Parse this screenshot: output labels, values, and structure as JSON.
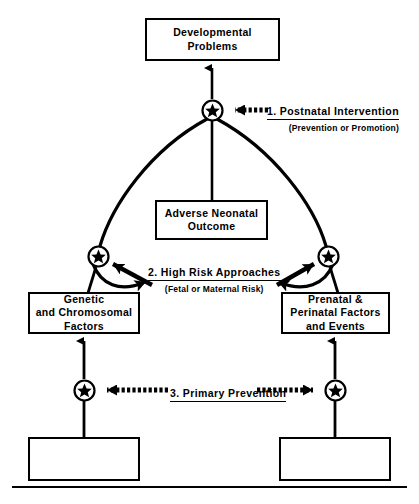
{
  "figure": {
    "accent_color": "#000000",
    "background_color": "#ffffff"
  },
  "boxes": {
    "developmental_problems": "Developmental\nProblems",
    "adverse_neonatal_outcome": "Adverse  Neonatal\nOutcome",
    "genetic_factors": "Genetic\nand  Chromosomal\nFactors",
    "prenatal_factors": "Prenatal   &\nPerinatal   Factors\nand  Events",
    "bottom_left_empty": "",
    "bottom_right_empty": ""
  },
  "interventions": [
    {
      "number": "1.",
      "label": "1. Postnatal Intervention",
      "sublabel": "(Prevention  or  Promotion)"
    },
    {
      "number": "2.",
      "label": "2. High  Risk  Approaches",
      "sublabel": "(Fetal or Maternal Risk)"
    },
    {
      "number": "3.",
      "label": "3.   Primary  Prevention",
      "sublabel": ""
    }
  ],
  "nodes": [
    {
      "id": "node-top",
      "icon": "star-node-icon",
      "x": 212,
      "y": 110
    },
    {
      "id": "node-left-mid",
      "icon": "star-node-icon",
      "x": 98,
      "y": 256
    },
    {
      "id": "node-right-mid",
      "icon": "star-node-icon",
      "x": 328,
      "y": 256
    },
    {
      "id": "node-left-bottom",
      "icon": "star-node-icon",
      "x": 84,
      "y": 390
    },
    {
      "id": "node-right-bottom",
      "icon": "star-node-icon",
      "x": 335,
      "y": 390
    }
  ]
}
